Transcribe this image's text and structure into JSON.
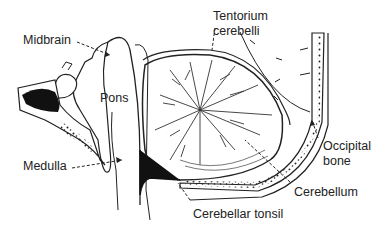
{
  "diagram": {
    "type": "anatomical-sagittal-section",
    "labels": [
      {
        "id": "midbrain",
        "text": "Midbrain",
        "x": 23,
        "y": 33
      },
      {
        "id": "tentorium",
        "text": "Tentorium\ncerebelli",
        "x": 213,
        "y": 10
      },
      {
        "id": "pons",
        "text": "Pons",
        "x": 100,
        "y": 91
      },
      {
        "id": "occipital",
        "text": "Occipital\nbone",
        "x": 323,
        "y": 139
      },
      {
        "id": "medulla",
        "text": "Medulla",
        "x": 23,
        "y": 154
      },
      {
        "id": "cerebellum",
        "text": "Cerebellum",
        "x": 294,
        "y": 185
      },
      {
        "id": "tonsil",
        "text": "Cerebellar tonsil",
        "x": 193,
        "y": 207
      }
    ]
  },
  "labels": {
    "midbrain": "Midbrain",
    "tentorium_1": "Tentorium",
    "tentorium_2": "cerebelli",
    "pons": "Pons",
    "occipital_1": "Occipital",
    "occipital_2": "bone",
    "medulla": "Medulla",
    "cerebellum": "Cerebellum",
    "tonsil": "Cerebellar tonsil"
  },
  "colors": {
    "ink": "#1a1a1a",
    "background": "#ffffff"
  }
}
